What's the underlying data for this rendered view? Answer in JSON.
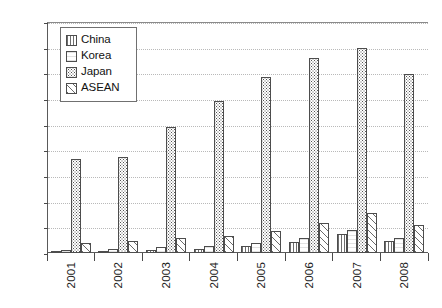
{
  "chart_data": {
    "type": "bar",
    "title": "",
    "xlabel": "",
    "ylabel": "",
    "categories": [
      "2001",
      "2002",
      "2003",
      "2004",
      "2005",
      "2006",
      "2007",
      "2008"
    ],
    "ylim": [
      0,
      4500
    ],
    "ytick_step": 500,
    "yticks": [
      "4500",
      "4000",
      "3500",
      "3000",
      "2500",
      "2000",
      "1500",
      "1000",
      "500",
      "0"
    ],
    "grid": "horizontal-dotted",
    "legend_position": "top-left-inside",
    "series": [
      {
        "name": "China",
        "pattern": "vertical-lines",
        "values": [
          20,
          30,
          60,
          70,
          130,
          210,
          380,
          240
        ]
      },
      {
        "name": "Korea",
        "pattern": "light-plain",
        "values": [
          50,
          80,
          110,
          140,
          200,
          290,
          440,
          290
        ]
      },
      {
        "name": "Japan",
        "pattern": "dotted",
        "values": [
          1830,
          1880,
          2460,
          2970,
          3420,
          3800,
          4000,
          3490
        ]
      },
      {
        "name": "ASEAN",
        "pattern": "cross-hatch",
        "values": [
          200,
          230,
          290,
          330,
          420,
          580,
          780,
          550
        ]
      }
    ]
  },
  "legend": {
    "items": [
      {
        "label": "China"
      },
      {
        "label": "Korea"
      },
      {
        "label": "Japan"
      },
      {
        "label": "ASEAN"
      }
    ]
  },
  "colors": {
    "axis": "#4a4a4a",
    "grid": "#b9b9b9",
    "bar_border": "#4d4d4d",
    "text": "#1b1b1b",
    "background": "#ffffff"
  }
}
